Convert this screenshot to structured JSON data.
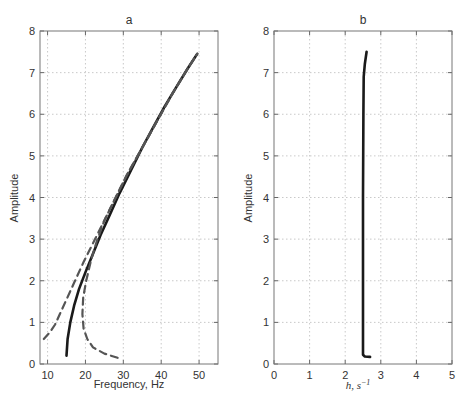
{
  "chart_data": [
    {
      "type": "line",
      "panel": "a",
      "title": "a",
      "xlabel": "Frequency,  Hz",
      "ylabel": "Amplitude",
      "xlim": [
        8,
        55
      ],
      "ylim": [
        0,
        8
      ],
      "xticks": [
        10,
        20,
        30,
        40,
        50
      ],
      "yticks": [
        0,
        1,
        2,
        3,
        4,
        5,
        6,
        7,
        8
      ],
      "grid": true,
      "series": [
        {
          "name": "backbone",
          "style": "solid",
          "x": [
            15,
            15.3,
            16,
            17,
            18.3,
            20,
            22,
            24,
            26.5,
            29,
            32,
            35,
            38,
            41,
            44,
            47,
            49.5
          ],
          "y": [
            0.2,
            0.6,
            1.0,
            1.4,
            1.8,
            2.2,
            2.65,
            3.1,
            3.6,
            4.1,
            4.65,
            5.2,
            5.7,
            6.2,
            6.65,
            7.1,
            7.45
          ]
        },
        {
          "name": "upper envelope",
          "style": "dashed",
          "x": [
            9,
            10.5,
            12,
            13.5,
            15,
            17,
            19.5,
            22,
            25,
            28,
            31,
            35,
            39,
            43,
            47,
            49.5
          ],
          "y": [
            0.6,
            0.75,
            0.95,
            1.25,
            1.55,
            1.95,
            2.45,
            2.9,
            3.45,
            4.0,
            4.55,
            5.2,
            5.85,
            6.5,
            7.1,
            7.45
          ]
        },
        {
          "name": "lower envelope",
          "style": "dashed",
          "x": [
            28.5,
            25,
            22,
            20.5,
            19.5,
            19.2,
            19.4,
            20.2,
            21.5,
            23,
            25,
            28,
            31,
            35,
            39,
            43,
            47,
            49.5
          ],
          "y": [
            0.15,
            0.25,
            0.4,
            0.6,
            0.85,
            1.2,
            1.6,
            2.0,
            2.5,
            2.95,
            3.45,
            4.0,
            4.55,
            5.2,
            5.85,
            6.5,
            7.1,
            7.45
          ]
        }
      ]
    },
    {
      "type": "line",
      "panel": "b",
      "title": "b",
      "xlabel": "h, s^-1",
      "ylabel": "Amplitude",
      "xlim": [
        0,
        5
      ],
      "ylim": [
        0,
        8
      ],
      "xticks": [
        0,
        1,
        2,
        3,
        4,
        5
      ],
      "yticks": [
        0,
        1,
        2,
        3,
        4,
        5,
        6,
        7,
        8
      ],
      "grid": true,
      "series": [
        {
          "name": "damping",
          "style": "solid",
          "x": [
            2.7,
            2.55,
            2.5,
            2.5,
            2.5,
            2.51,
            2.52,
            2.55,
            2.6
          ],
          "y": [
            0.17,
            0.18,
            0.22,
            2.0,
            4.0,
            6.0,
            6.9,
            7.2,
            7.5
          ]
        }
      ]
    }
  ],
  "labels": {
    "a_title": "a",
    "b_title": "b",
    "a_xlabel": "Frequency,  Hz",
    "a_ylabel": "Amplitude",
    "b_xlabel_base": "h, s",
    "b_xlabel_sup": "−1",
    "b_ylabel": "Amplitude"
  }
}
